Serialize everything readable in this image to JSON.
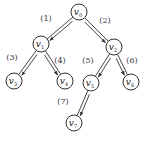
{
  "diagram": {
    "type": "binary-tree",
    "nodes": [
      {
        "id": "v0",
        "label": "v",
        "sub": "0",
        "x": 79,
        "y": 12
      },
      {
        "id": "v1",
        "label": "v",
        "sub": "1",
        "x": 41,
        "y": 44
      },
      {
        "id": "v2",
        "label": "v",
        "sub": "2",
        "x": 114,
        "y": 47
      },
      {
        "id": "v3",
        "label": "v",
        "sub": "3",
        "x": 14,
        "y": 81
      },
      {
        "id": "v4",
        "label": "v",
        "sub": "4",
        "x": 65,
        "y": 81
      },
      {
        "id": "v5",
        "label": "v",
        "sub": "5",
        "x": 91,
        "y": 83
      },
      {
        "id": "v6",
        "label": "v",
        "sub": "6",
        "x": 131,
        "y": 82
      },
      {
        "id": "v7",
        "label": "v",
        "sub": "7",
        "x": 74,
        "y": 123
      }
    ],
    "edges": [
      {
        "from": "v0",
        "to": "v1",
        "label": "(1)",
        "lx": 46,
        "ly": 21
      },
      {
        "from": "v0",
        "to": "v2",
        "label": "(2)",
        "lx": 105,
        "ly": 23
      },
      {
        "from": "v1",
        "to": "v3",
        "label": "(3)",
        "lx": 12,
        "ly": 60
      },
      {
        "from": "v1",
        "to": "v4",
        "label": "(4)",
        "lx": 60,
        "ly": 63
      },
      {
        "from": "v2",
        "to": "v5",
        "label": "(5)",
        "lx": 88,
        "ly": 63
      },
      {
        "from": "v2",
        "to": "v6",
        "label": "(6)",
        "lx": 132,
        "ly": 63
      },
      {
        "from": "v5",
        "to": "v7",
        "label": "(7)",
        "lx": 63,
        "ly": 104
      }
    ]
  }
}
